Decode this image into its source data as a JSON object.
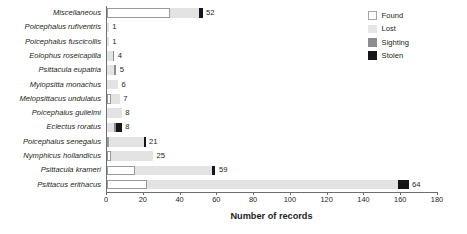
{
  "chart_data": {
    "type": "bar",
    "orientation": "horizontal",
    "stacked": true,
    "title": "",
    "xlabel": "Number of records",
    "ylabel": "",
    "xlim": [
      0,
      180
    ],
    "xticks": [
      0,
      20,
      40,
      60,
      80,
      100,
      120,
      140,
      160,
      180
    ],
    "grid": false,
    "legend_position": "top-right",
    "legend": [
      "Found",
      "Lost",
      "Sighting",
      "Stolen"
    ],
    "series": [
      {
        "name": "Found",
        "color": "#ffffff",
        "values": [
          34,
          0,
          0,
          0,
          0,
          0,
          2,
          0,
          0,
          1,
          2,
          15,
          22
        ]
      },
      {
        "name": "Lost",
        "color": "#e3e3e3",
        "values": [
          16,
          1,
          1,
          3,
          4,
          6,
          5,
          8,
          4,
          19,
          23,
          42,
          136
        ]
      },
      {
        "name": "Sighting",
        "color": "#8d8d8d",
        "values": [
          0,
          0,
          0,
          1,
          1,
          0,
          0,
          0,
          1,
          0,
          0,
          0,
          0
        ]
      },
      {
        "name": "Stolen",
        "color": "#161616",
        "values": [
          2,
          0,
          0,
          0,
          0,
          0,
          0,
          0,
          3,
          1,
          0,
          2,
          6
        ]
      }
    ],
    "categories": [
      "Miscellaneous",
      "Poicephalus rufiventris",
      "Poicephalus fuscicollis",
      "Eolophus roseicapilla",
      "Psittacula eupatria",
      "Myiopsitta monachus",
      "Melopsittacus undulatus",
      "Poicephalus gulielmi",
      "Eclectus roratus",
      "Poicephalus senegalus",
      "Nymphicus hollandicus",
      "Psittacula krameri",
      "Psittacus erithacus"
    ],
    "bar_labels": [
      "52",
      "1",
      "1",
      "4",
      "5",
      "6",
      "7",
      "8",
      "8",
      "21",
      "25",
      "59",
      "64"
    ],
    "bar_totals": [
      52,
      1,
      1,
      4,
      5,
      6,
      7,
      8,
      8,
      21,
      25,
      59,
      164
    ]
  },
  "axis": {
    "x_title": "Number of records",
    "tick_labels": [
      "0",
      "20",
      "40",
      "60",
      "80",
      "100",
      "120",
      "140",
      "160",
      "180"
    ]
  },
  "legend": {
    "items": [
      {
        "label": "Found",
        "key": "found"
      },
      {
        "label": "Lost",
        "key": "lost"
      },
      {
        "label": "Sighting",
        "key": "sighting"
      },
      {
        "label": "Stolen",
        "key": "stolen"
      }
    ]
  },
  "colors": {
    "found": "#ffffff",
    "lost": "#e3e3e3",
    "sighting": "#8d8d8d",
    "stolen": "#161616",
    "axis": "#6d6e71",
    "text": "#231f20"
  }
}
